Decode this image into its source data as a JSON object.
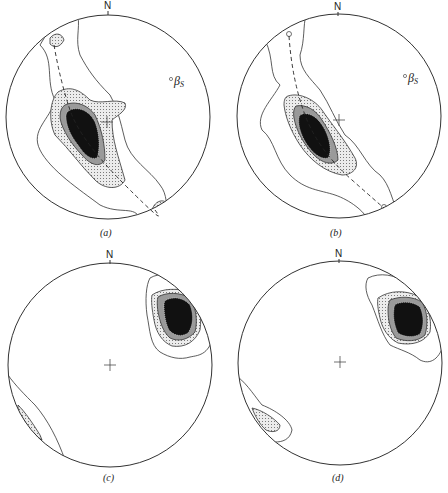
{
  "figure": {
    "type": "stereonet-contour-diagrams",
    "panels": [
      {
        "id": "a",
        "caption": "(a)",
        "north_label": "N",
        "annotation": "β",
        "annotation_sub": "S",
        "has_great_circle": true
      },
      {
        "id": "b",
        "caption": "(b)",
        "north_label": "N",
        "annotation": "β",
        "annotation_sub": "S",
        "has_great_circle": true
      },
      {
        "id": "c",
        "caption": "(c)",
        "north_label": "N",
        "has_great_circle": false
      },
      {
        "id": "d",
        "caption": "(d)",
        "north_label": "N",
        "has_great_circle": false
      }
    ],
    "colors": {
      "outline": "#333333",
      "level1_fill": "#ffffff",
      "level2_fill": "#d9d9d9",
      "level3_fill": "#9a9a9a",
      "level4_fill": "#111111"
    }
  }
}
